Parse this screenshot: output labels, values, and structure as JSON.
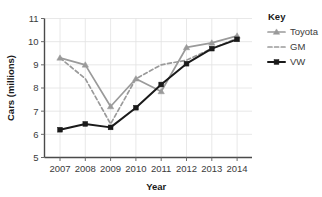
{
  "chart_data": {
    "type": "line",
    "title": "",
    "xlabel": "Year",
    "ylabel": "Cars (millions)",
    "categories": [
      "2007",
      "2008",
      "2009",
      "2010",
      "2011",
      "2012",
      "2013",
      "2014"
    ],
    "x": [
      2007,
      2008,
      2009,
      2010,
      2011,
      2012,
      2013,
      2014
    ],
    "xlim": [
      2006.6,
      2014.5
    ],
    "ylim": [
      5,
      11
    ],
    "yticks": [
      5,
      6,
      7,
      8,
      9,
      10,
      11
    ],
    "ytick_labels": [
      "5",
      "6",
      "7",
      "8",
      "9",
      "10",
      "11"
    ],
    "grid": true,
    "legend_position": "right",
    "legend_title": "Key",
    "series": [
      {
        "name": "Toyota",
        "color": "#9a9a9a",
        "style": "solid",
        "marker": "triangle",
        "values": [
          9.3,
          9.0,
          7.2,
          8.4,
          7.85,
          9.75,
          9.95,
          10.25
        ]
      },
      {
        "name": "GM",
        "color": "#9a9a9a",
        "style": "dashed",
        "marker": "none",
        "values": [
          9.3,
          8.4,
          6.45,
          8.4,
          9.0,
          9.2,
          9.7,
          10.15
        ]
      },
      {
        "name": "VW",
        "color": "#1a1a1a",
        "style": "solid",
        "marker": "square",
        "values": [
          6.2,
          6.45,
          6.3,
          7.15,
          8.15,
          9.05,
          9.7,
          10.1
        ]
      }
    ]
  },
  "axes": {
    "y_title": "Cars (millions)",
    "x_title": "Year"
  },
  "legend": {
    "title": "Key",
    "entries": [
      {
        "label": "Toyota"
      },
      {
        "label": "GM"
      },
      {
        "label": "VW"
      }
    ]
  },
  "colors": {
    "gray_series": "#9a9a9a",
    "black_series": "#1a1a1a",
    "grid": "#e2e2e2",
    "axis": "#4a4a4a",
    "text": "#3b3b3b"
  }
}
